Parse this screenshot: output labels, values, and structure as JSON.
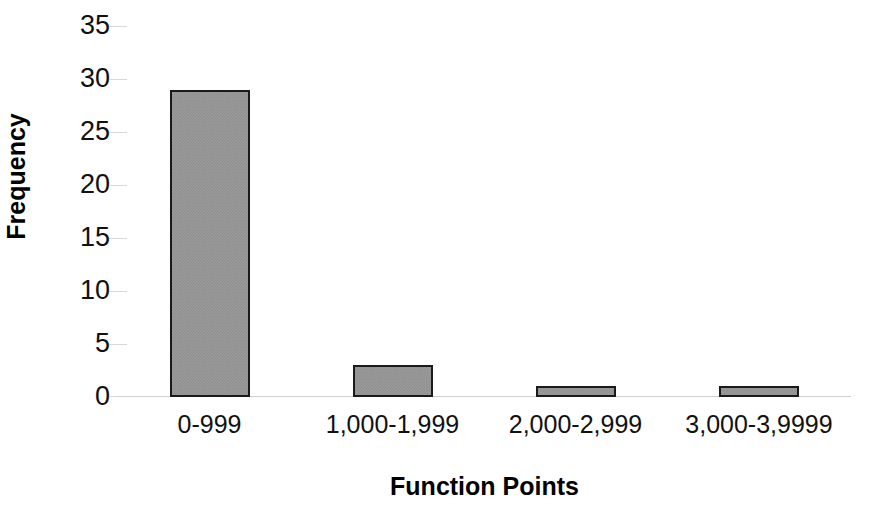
{
  "chart_data": {
    "type": "bar",
    "title": "",
    "subtitle": "",
    "xlabel": "Function Points",
    "ylabel": "Frequency",
    "categories": [
      "0-999",
      "1,000-1,999",
      "2,000-2,999",
      "3,000-3,9999"
    ],
    "values": [
      29,
      3,
      1,
      1
    ],
    "series": [
      {
        "name": "Frequency",
        "values": [
          29,
          3,
          1,
          1
        ]
      }
    ],
    "ylim": [
      0,
      35
    ],
    "y_ticks": [
      0,
      5,
      10,
      15,
      20,
      25,
      30,
      35
    ],
    "y_tick_labels": [
      "0",
      "5",
      "10",
      "15",
      "20",
      "25",
      "30",
      "35"
    ],
    "grid": false,
    "legend": false,
    "legend_position": "none",
    "colors": {
      "bar_fill": "#9a9a9a",
      "bar_border": "#1a1a1a",
      "axis_line": "#d0d0d0",
      "tick_mark": "#d8d8d8",
      "text": "#111111",
      "background": "#ffffff"
    }
  }
}
